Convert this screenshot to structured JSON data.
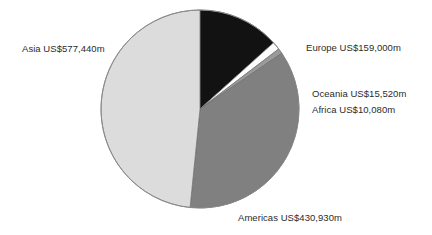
{
  "chart_data": {
    "type": "pie",
    "title": "",
    "subtitle": "",
    "xlabel": "",
    "ylabel": "",
    "grid": false,
    "legend_position": "none",
    "units": "US$ millions",
    "total": 1192970,
    "categories": [
      "Europe",
      "Oceania",
      "Africa",
      "Americas",
      "Asia"
    ],
    "values": [
      159000,
      15520,
      10080,
      430930,
      577440
    ],
    "percentages": [
      13.33,
      1.3,
      0.85,
      36.12,
      48.4
    ],
    "colors": [
      "#121212",
      "#fdfdfd",
      "#9a9a9a",
      "#808080",
      "#dcdcdc"
    ],
    "slices": [
      {
        "name": "Europe",
        "value": 159000,
        "label": "Europe US$159,000m",
        "percent": 13.33,
        "color": "#121212",
        "start_angle": 0,
        "end_angle": 48.0
      },
      {
        "name": "Oceania",
        "value": 15520,
        "label": "Oceania US$15,520m",
        "percent": 1.3,
        "color": "#fdfdfd",
        "start_angle": 48.0,
        "end_angle": 52.68
      },
      {
        "name": "Africa",
        "value": 10080,
        "label": "Africa US$10,080m",
        "percent": 0.85,
        "color": "#9a9a9a",
        "start_angle": 52.68,
        "end_angle": 55.72
      },
      {
        "name": "Americas",
        "value": 430930,
        "label": "Americas US$430,930m",
        "percent": 36.12,
        "color": "#808080",
        "start_angle": 55.72,
        "end_angle": 185.76
      },
      {
        "name": "Asia",
        "value": 577440,
        "label": "Asia US$577,440m",
        "percent": 48.4,
        "color": "#dcdcdc",
        "start_angle": 185.76,
        "end_angle": 360
      }
    ],
    "geometry": {
      "center_x": 200,
      "center_y": 109,
      "radius": 99,
      "outline_color": "#8a8a8a"
    }
  },
  "labels": {
    "asia": "Asia US$577,440m",
    "europe": "Europe US$159,000m",
    "oceania": "Oceania US$15,520m",
    "africa": "Africa US$10,080m",
    "americas": "Americas US$430,930m"
  }
}
